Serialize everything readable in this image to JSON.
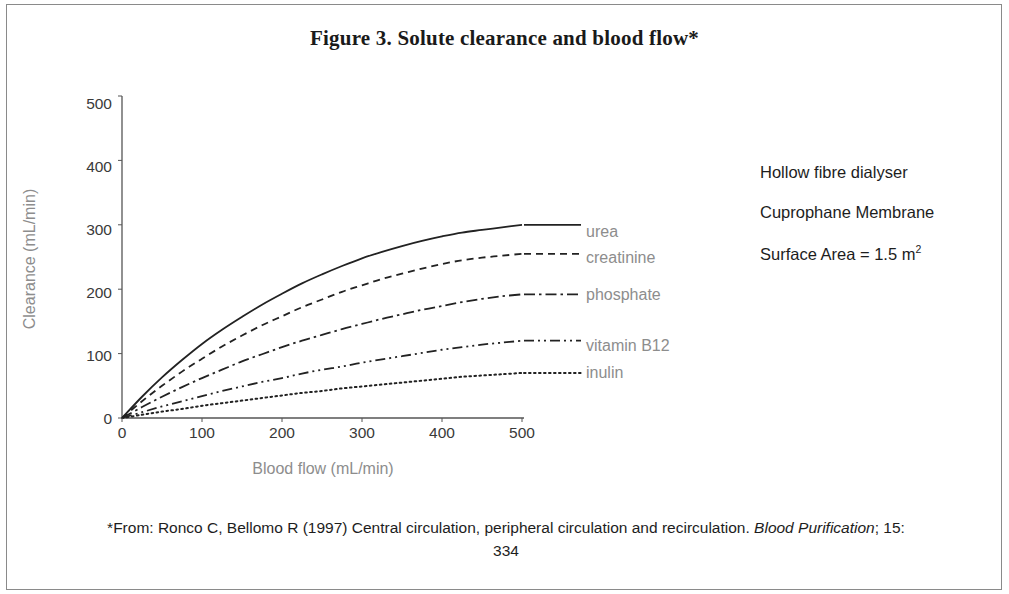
{
  "figure": {
    "title": "Figure 3.  Solute clearance and blood flow*",
    "footnote_part1": "*From: Ronco C, Bellomo R (1997) Central circulation, peripheral circulation and recirculation. ",
    "footnote_italic": "Blood Purification",
    "footnote_part2": "; 15: 334"
  },
  "annotations": {
    "line1": "Hollow fibre dialyser",
    "line2": "Cuprophane Membrane",
    "line3_text": "Surface Area = 1.5 m",
    "line3_sup": "2"
  },
  "chart_data": {
    "type": "line",
    "title": "Figure 3.  Solute clearance and blood flow*",
    "xlabel": "Blood flow (mL/min)",
    "ylabel": "Clearance (mL/min)",
    "xlim": [
      0,
      500
    ],
    "ylim": [
      0,
      500
    ],
    "xticks": [
      0,
      100,
      200,
      300,
      400,
      500
    ],
    "yticks": [
      0,
      100,
      200,
      300,
      400,
      500
    ],
    "grid": false,
    "legend": "inline end-of-curve labels",
    "x": [
      0,
      25,
      50,
      75,
      100,
      125,
      150,
      175,
      200,
      225,
      250,
      275,
      300,
      325,
      350,
      375,
      400,
      425,
      450,
      475,
      500
    ],
    "series": [
      {
        "name": "urea",
        "style": "solid",
        "color": "#222222",
        "label": "urea",
        "values": [
          0,
          33,
          63,
          90,
          115,
          137,
          157,
          176,
          193,
          209,
          223,
          236,
          248,
          258,
          267,
          275,
          282,
          288,
          292,
          296,
          300
        ]
      },
      {
        "name": "creatinine",
        "style": "dashed",
        "color": "#222222",
        "label": "creatinine",
        "values": [
          0,
          26,
          50,
          72,
          92,
          111,
          128,
          144,
          158,
          172,
          184,
          196,
          206,
          216,
          224,
          232,
          239,
          245,
          249,
          252,
          255
        ]
      },
      {
        "name": "phosphate",
        "style": "dash-dot",
        "color": "#222222",
        "label": "phosphate",
        "values": [
          0,
          17,
          33,
          48,
          62,
          75,
          88,
          99,
          110,
          120,
          129,
          138,
          146,
          154,
          161,
          168,
          174,
          180,
          185,
          189,
          192
        ]
      },
      {
        "name": "vitamin B12",
        "style": "dash-dot-dot",
        "color": "#222222",
        "label": "vitamin B12",
        "values": [
          0,
          9,
          18,
          26,
          34,
          42,
          49,
          56,
          62,
          69,
          75,
          80,
          86,
          91,
          96,
          101,
          106,
          110,
          114,
          117,
          120
        ]
      },
      {
        "name": "inulin",
        "style": "dotted",
        "color": "#222222",
        "label": "inulin",
        "values": [
          0,
          5,
          10,
          14,
          19,
          23,
          27,
          31,
          35,
          39,
          42,
          46,
          49,
          52,
          55,
          58,
          61,
          64,
          66,
          68,
          70
        ]
      }
    ]
  }
}
